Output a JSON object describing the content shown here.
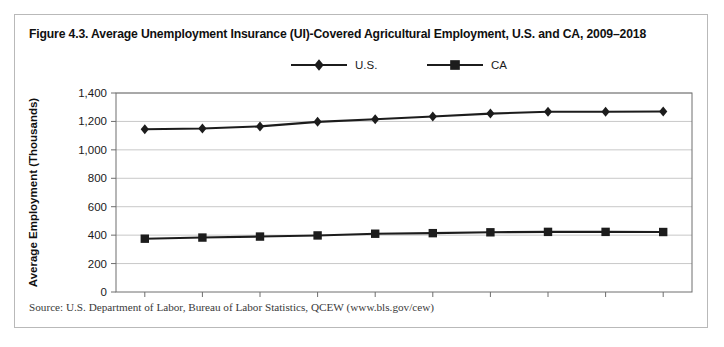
{
  "figure": {
    "title": "Figure 4.3. Average Unemployment Insurance (UI)-Covered Agricultural Employment, U.S. and CA, 2009–2018",
    "source": "Source: U.S. Department of Labor, Bureau of Labor Statistics, QCEW (www.bls.gov/cew)"
  },
  "chart_data": {
    "type": "line",
    "title": "Figure 4.3. Average Unemployment Insurance (UI)-Covered Agricultural Employment, U.S. and CA, 2009–2018",
    "xlabel": "",
    "ylabel": "Average Employment (Thousands)",
    "categories": [
      "2009",
      "2010",
      "2011",
      "2012",
      "2013",
      "2014",
      "2015",
      "2016",
      "2017",
      "2018"
    ],
    "x": [
      2009,
      2010,
      2011,
      2012,
      2013,
      2014,
      2015,
      2016,
      2017,
      2018
    ],
    "series": [
      {
        "name": "U.S.",
        "marker": "diamond",
        "color": "#1c1c1c",
        "values": [
          1145,
          1150,
          1165,
          1197,
          1215,
          1235,
          1255,
          1268,
          1268,
          1270
        ]
      },
      {
        "name": "CA",
        "marker": "square",
        "color": "#1c1c1c",
        "values": [
          375,
          383,
          390,
          398,
          410,
          414,
          420,
          423,
          423,
          422
        ]
      }
    ],
    "ylim": [
      0,
      1400
    ],
    "ytick_step": 200,
    "yticks": [
      0,
      200,
      400,
      600,
      800,
      1000,
      1200,
      1400
    ],
    "ytick_labels": [
      "0",
      "200",
      "400",
      "600",
      "800",
      "1,000",
      "1,200",
      "1,400"
    ],
    "grid": true,
    "grid_axis": "y",
    "legend_position": "top-center"
  }
}
